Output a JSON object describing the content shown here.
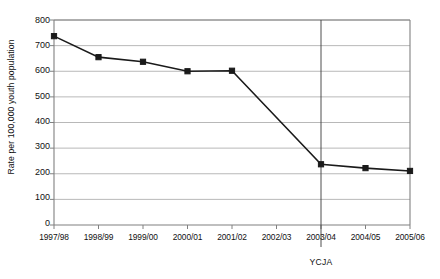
{
  "chart_data": {
    "type": "line",
    "title": "",
    "xlabel": "",
    "ylabel": "Rate per 100,000 youth population",
    "categories": [
      "1997/98",
      "1998/99",
      "1999/00",
      "2000/01",
      "2001/02",
      "2002/03",
      "2003/04",
      "2004/05",
      "2005/06"
    ],
    "values": [
      737,
      655,
      637,
      600,
      602,
      null,
      237,
      222,
      211
    ],
    "markers": [
      true,
      true,
      true,
      true,
      true,
      false,
      true,
      true,
      true
    ],
    "ylim": [
      0,
      800
    ],
    "yticks": [
      0,
      100,
      200,
      300,
      400,
      500,
      600,
      700,
      800
    ],
    "ytick_labels": [
      "0",
      "100",
      "200",
      "300",
      "400",
      "500",
      "600",
      "700",
      "800"
    ],
    "grid": true,
    "legend": false,
    "series_color": "#1a1a1a",
    "grid_color": "#a6a6a6",
    "axis_color": "#808080",
    "annotations": [
      {
        "name": "ycja-marker",
        "label": "YCJA",
        "at_category": "2003/04",
        "type": "vertical-line"
      }
    ]
  }
}
